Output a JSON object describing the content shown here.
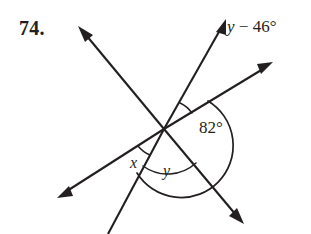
{
  "problem": {
    "number": "74."
  },
  "labels": {
    "expression_variable": "y",
    "expression_rest": " − 46°",
    "angle_82": "82°",
    "angle_x": "x",
    "angle_y": "y"
  },
  "colors": {
    "ink": "#231f20",
    "background": "#ffffff"
  },
  "figure": {
    "vertex": {
      "x": 164,
      "y": 129
    },
    "rays": [
      {
        "name": "upper-left",
        "tip_x": 79,
        "tip_y": 28,
        "arrow": true
      },
      {
        "name": "lower-right",
        "tip_x": 243,
        "tip_y": 223,
        "arrow": true
      },
      {
        "name": "lower-left",
        "tip_x": 58,
        "tip_y": 197,
        "arrow": true
      },
      {
        "name": "upper-right-shallow",
        "tip_x": 272,
        "tip_y": 62,
        "arrow": true
      },
      {
        "name": "upper-right-steep",
        "tip_x": 226,
        "tip_y": 20,
        "arrow": true
      },
      {
        "name": "bottom",
        "tip_x": 108,
        "tip_y": 234,
        "arrow": false
      }
    ],
    "arcs": [
      {
        "name": "arc-expression",
        "radius": 30
      },
      {
        "name": "arc-82",
        "radius": 52
      },
      {
        "name": "arc-x",
        "radius": 30
      },
      {
        "name": "arc-y",
        "radius": 42
      }
    ]
  }
}
